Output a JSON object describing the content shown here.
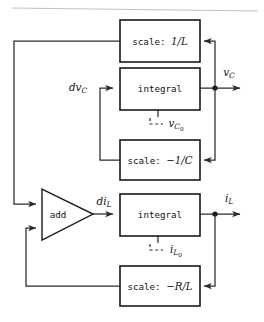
{
  "figure": {
    "kind": "control-block-diagram",
    "background_color": "#ffffff",
    "line_color": "#2b2b2b",
    "block_stroke_color": "#1a1a1a",
    "block_fill_color": "#ffffff"
  },
  "blocks": {
    "scale_inv_L": {
      "op": "scale:",
      "gain": "1/L",
      "full_label": "scale: 1/L"
    },
    "integral_top": {
      "label": "integral"
    },
    "scale_neg_inv_C": {
      "op": "scale:",
      "gain": "−1/C",
      "full_label": "scale: −1/C"
    },
    "adder": {
      "label": "add"
    },
    "integral_bottom": {
      "label": "integral"
    },
    "scale_neg_R_over_L": {
      "op": "scale:",
      "gain": "−R/L",
      "full_label": "scale: −R/L"
    }
  },
  "signals": {
    "dvc": {
      "base": "dv",
      "sub": "C",
      "subsub": ""
    },
    "vc_out": {
      "base": "v",
      "sub": "C",
      "subsub": ""
    },
    "vc0_init": {
      "base": "v",
      "sub": "C",
      "subsub": "0"
    },
    "dil": {
      "base": "di",
      "sub": "L",
      "subsub": ""
    },
    "il_out": {
      "base": "i",
      "sub": "L",
      "subsub": ""
    },
    "il0_init": {
      "base": "i",
      "sub": "L",
      "subsub": "0"
    }
  },
  "initial_condition_marker": {
    "glyph": "L –",
    "description": "dashed corner tick feeding initial condition into integrator"
  }
}
